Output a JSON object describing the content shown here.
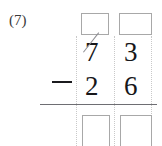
{
  "problem": {
    "label": "(7)",
    "type": "vertical-subtraction",
    "operator": "−",
    "minuend": {
      "digits": [
        "7",
        "3"
      ],
      "value": "73",
      "tens_digit_crossed_out": true
    },
    "subtrahend": {
      "digits": [
        "2",
        "6"
      ],
      "value": "26"
    },
    "answer": {
      "digits": [
        "",
        ""
      ],
      "placeholder": ""
    },
    "regroup_boxes": {
      "values": [
        "",
        ""
      ],
      "count": 2
    },
    "columns": [
      "tens",
      "ones"
    ]
  },
  "style": {
    "background": "#ffffff",
    "digit_color": "#17171a",
    "label_color": "#3a3a3a",
    "box_border_color": "#a8a8a8",
    "guide_color": "#c9c9c9",
    "rule_color": "#6e6e73",
    "strike_color": "#8d8d92"
  },
  "icons": {
    "minus": "minus-operator-icon",
    "strikethrough": "strikethrough-slash-icon"
  }
}
